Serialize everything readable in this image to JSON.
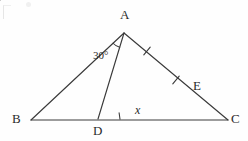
{
  "figure": {
    "kind": "euclidean-geometry-diagram",
    "width": 248,
    "height": 141,
    "stroke_color": "#3a3a3a",
    "background_color": "#fefefe",
    "text_color": "#2b2b2b"
  },
  "points": {
    "A": {
      "label": "A",
      "x": 124,
      "y": 33,
      "label_x": 120,
      "label_y": 8
    },
    "B": {
      "label": "B",
      "x": 31,
      "y": 120,
      "label_x": 12,
      "label_y": 112
    },
    "C": {
      "label": "C",
      "x": 228,
      "y": 120,
      "label_x": 231,
      "label_y": 112
    },
    "D": {
      "label": "D",
      "x": 98,
      "y": 119,
      "label_x": 93,
      "label_y": 124
    },
    "E": {
      "label": "E",
      "x": 190,
      "y": 92,
      "label_x": 193,
      "label_y": 79
    }
  },
  "segments": [
    {
      "name": "side-AB",
      "from": "A",
      "to": "B"
    },
    {
      "name": "side-AC",
      "from": "A",
      "to": "C"
    },
    {
      "name": "base-BC",
      "from": "B",
      "to": "C"
    },
    {
      "name": "cevian-AD",
      "from": "A",
      "to": "D"
    },
    {
      "name": "segment-DE",
      "from": "D",
      "to": "E"
    }
  ],
  "angles": [
    {
      "name": "angle-BAD",
      "vertex": "A",
      "label": "30°",
      "label_x": 93,
      "label_y": 50,
      "style": "arc"
    },
    {
      "name": "angle-EDC",
      "vertex": "D",
      "label": "x",
      "label_x": 135,
      "label_y": 104,
      "style": "tick"
    }
  ],
  "tick_marks": [
    {
      "name": "tick-on-AC-upper",
      "x": 147,
      "y": 51
    },
    {
      "name": "tick-on-AC-lower",
      "x": 176,
      "y": 80
    }
  ]
}
